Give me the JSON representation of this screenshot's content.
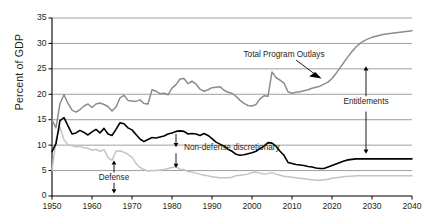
{
  "chart_data": {
    "type": "line",
    "title": "",
    "subtitle": "",
    "xlabel": "",
    "ylabel": "Percent of GDP",
    "xlim": [
      1950,
      2040
    ],
    "ylim": [
      0,
      35
    ],
    "grid": true,
    "legend": "annotations-inline",
    "y_ticks": [
      0,
      5,
      10,
      15,
      20,
      25,
      30,
      35
    ],
    "x_ticks": [
      1950,
      1960,
      1970,
      1980,
      1990,
      2000,
      2010,
      2020,
      2030,
      2040
    ],
    "y_tick_labels": [
      "0",
      "5",
      "10",
      "15",
      "20",
      "25",
      "30",
      "35"
    ],
    "x_tick_labels": [
      "1950",
      "1960",
      "1970",
      "1980",
      "1990",
      "2000",
      "2010",
      "2020",
      "2030",
      "2040"
    ],
    "colors": {
      "total_program_outlays": "#8c8c8c",
      "defense": "#000000",
      "non_defense_discretionary": "#c4c4c4",
      "gridline": "#7f7f7f",
      "axis": "#000000",
      "text": "#231f20"
    },
    "annotations": [
      {
        "name": "total-program-outlays-label",
        "text": "Total Program Outlays",
        "x": 2008,
        "y": 28.2,
        "arrow": "to-series"
      },
      {
        "name": "entitlements-label",
        "text": "Entitlements",
        "x": 2028,
        "y": 18.3,
        "arrow": "double-vertical"
      },
      {
        "name": "defense-label",
        "text": "Defense",
        "x": 1965,
        "y": 3.6,
        "arrow": "double-vertical"
      },
      {
        "name": "non-defense-discretionary-label",
        "text": "Non-defense discretionary",
        "x": 1981,
        "y": 9.0,
        "arrow": "down"
      }
    ],
    "series": [
      {
        "name": "Total Program Outlays",
        "color": "#8c8c8c",
        "x": [
          1950,
          1951,
          1952,
          1953,
          1954,
          1955,
          1956,
          1957,
          1958,
          1959,
          1960,
          1961,
          1962,
          1963,
          1964,
          1965,
          1966,
          1967,
          1968,
          1969,
          1970,
          1971,
          1972,
          1973,
          1974,
          1975,
          1976,
          1977,
          1978,
          1979,
          1980,
          1981,
          1982,
          1983,
          1984,
          1985,
          1986,
          1987,
          1988,
          1989,
          1990,
          1991,
          1992,
          1993,
          1994,
          1995,
          1996,
          1997,
          1998,
          1999,
          2000,
          2001,
          2002,
          2003,
          2004,
          2005,
          2006,
          2007,
          2008,
          2009,
          2010,
          2011,
          2012,
          2013,
          2014,
          2015,
          2016,
          2017,
          2018,
          2019,
          2020,
          2021,
          2022,
          2023,
          2024,
          2025,
          2026,
          2027,
          2028,
          2029,
          2030,
          2031,
          2032,
          2033,
          2034,
          2035,
          2036,
          2037,
          2038,
          2039,
          2040
        ],
        "y": [
          15.0,
          13.4,
          18.2,
          19.9,
          18.2,
          16.9,
          16.5,
          17.0,
          17.7,
          18.1,
          17.4,
          18.1,
          18.3,
          18.0,
          17.6,
          16.7,
          17.5,
          19.3,
          19.8,
          18.8,
          18.7,
          18.6,
          18.9,
          18.2,
          18.1,
          20.9,
          20.6,
          20.1,
          20.2,
          19.9,
          21.2,
          21.9,
          23.0,
          23.1,
          22.1,
          22.6,
          22.0,
          21.0,
          20.6,
          20.9,
          21.3,
          21.4,
          21.5,
          20.8,
          20.4,
          20.2,
          19.6,
          18.8,
          18.2,
          17.8,
          17.7,
          18.0,
          19.1,
          19.7,
          19.6,
          24.4,
          23.3,
          22.8,
          22.2,
          20.5,
          20.2,
          20.4,
          20.5,
          20.7,
          20.9,
          21.2,
          21.4,
          21.6,
          22.0,
          22.4,
          23.1,
          24.1,
          25.2,
          26.3,
          27.4,
          28.4,
          29.3,
          30.0,
          30.5,
          30.9,
          31.2,
          31.4,
          31.6,
          31.8,
          31.9,
          32.0,
          32.1,
          32.2,
          32.3,
          32.4,
          32.5
        ]
      },
      {
        "name": "Defense",
        "color": "#000000",
        "x": [
          1950,
          1951,
          1952,
          1953,
          1954,
          1955,
          1956,
          1957,
          1958,
          1959,
          1960,
          1961,
          1962,
          1963,
          1964,
          1965,
          1966,
          1967,
          1968,
          1969,
          1970,
          1971,
          1972,
          1973,
          1974,
          1975,
          1976,
          1977,
          1978,
          1979,
          1980,
          1981,
          1982,
          1983,
          1984,
          1985,
          1986,
          1987,
          1988,
          1989,
          1990,
          1991,
          1992,
          1993,
          1994,
          1995,
          1996,
          1997,
          1998,
          1999,
          2000,
          2001,
          2002,
          2003,
          2004,
          2005,
          2006,
          2007,
          2008,
          2009,
          2010,
          2011,
          2012,
          2013,
          2014,
          2015,
          2016,
          2017,
          2018,
          2019,
          2020,
          2021,
          2022,
          2023,
          2024,
          2025,
          2026,
          2027,
          2028,
          2029,
          2030,
          2031,
          2032,
          2033,
          2034,
          2035,
          2036,
          2037,
          2038,
          2039,
          2040
        ],
        "y": [
          8.7,
          10.3,
          14.8,
          15.4,
          13.8,
          12.2,
          12.4,
          12.9,
          12.5,
          12.0,
          12.6,
          13.1,
          12.4,
          13.3,
          12.2,
          11.9,
          13.1,
          14.4,
          14.2,
          13.4,
          13.0,
          12.1,
          11.2,
          10.7,
          11.1,
          11.5,
          11.4,
          11.6,
          11.8,
          12.2,
          12.4,
          12.7,
          12.8,
          12.7,
          12.2,
          12.3,
          12.2,
          11.9,
          12.3,
          11.9,
          11.3,
          10.6,
          10.2,
          9.8,
          9.2,
          8.8,
          8.2,
          8.0,
          8.1,
          8.3,
          8.5,
          8.8,
          9.3,
          9.8,
          10.5,
          10.4,
          9.8,
          8.8,
          8.0,
          6.6,
          6.4,
          6.2,
          6.1,
          6.0,
          5.8,
          5.7,
          5.5,
          5.4,
          5.4,
          5.7,
          6.0,
          6.3,
          6.6,
          6.9,
          7.1,
          7.2,
          7.3,
          7.3,
          7.3,
          7.3,
          7.3,
          7.3,
          7.3,
          7.3,
          7.3,
          7.3,
          7.3,
          7.3,
          7.3,
          7.3,
          7.3
        ]
      },
      {
        "name": "Non-defense discretionary",
        "color": "#c4c4c4",
        "x": [
          1950,
          1951,
          1952,
          1953,
          1954,
          1955,
          1956,
          1957,
          1958,
          1959,
          1960,
          1961,
          1962,
          1963,
          1964,
          1965,
          1966,
          1967,
          1968,
          1969,
          1970,
          1971,
          1972,
          1973,
          1974,
          1975,
          1976,
          1977,
          1978,
          1979,
          1980,
          1981,
          1982,
          1983,
          1984,
          1985,
          1986,
          1987,
          1988,
          1989,
          1990,
          1991,
          1992,
          1993,
          1994,
          1995,
          1996,
          1997,
          1998,
          1999,
          2000,
          2001,
          2002,
          2003,
          2004,
          2005,
          2006,
          2007,
          2008,
          2009,
          2010,
          2011,
          2012,
          2013,
          2014,
          2015,
          2016,
          2017,
          2018,
          2019,
          2020,
          2021,
          2022,
          2023,
          2024,
          2025,
          2026,
          2027,
          2028,
          2029,
          2030,
          2031,
          2032,
          2033,
          2034,
          2035,
          2036,
          2037,
          2038,
          2039,
          2040
        ],
        "y": [
          5.0,
          11.0,
          13.5,
          11.0,
          10.1,
          9.9,
          9.7,
          9.8,
          9.5,
          9.4,
          9.0,
          9.2,
          8.8,
          9.1,
          7.6,
          7.0,
          8.8,
          8.9,
          8.6,
          8.2,
          7.6,
          6.4,
          5.6,
          5.2,
          4.9,
          5.0,
          5.0,
          5.1,
          5.2,
          5.4,
          5.6,
          5.8,
          5.2,
          5.2,
          4.8,
          4.7,
          4.5,
          4.3,
          4.1,
          4.0,
          3.8,
          3.7,
          3.6,
          3.6,
          3.6,
          3.7,
          4.0,
          4.1,
          4.2,
          4.3,
          4.6,
          4.7,
          4.5,
          4.3,
          4.4,
          4.6,
          4.3,
          4.1,
          3.9,
          3.8,
          3.7,
          3.6,
          3.5,
          3.4,
          3.3,
          3.2,
          3.1,
          3.1,
          3.2,
          3.3,
          3.5,
          3.6,
          3.7,
          3.8,
          3.9,
          3.9,
          4.0,
          4.0,
          4.0,
          4.0,
          4.0,
          4.0,
          4.0,
          4.0,
          4.0,
          4.0,
          4.0,
          4.0,
          4.0,
          4.0,
          4.0
        ]
      }
    ]
  }
}
